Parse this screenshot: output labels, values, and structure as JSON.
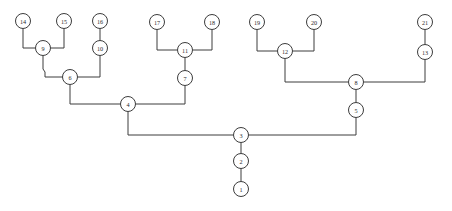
{
  "figure": {
    "type": "tree-diagram",
    "title": "",
    "background_color": "#ffffff",
    "line_color": "#3c3c3c",
    "node_fill_color": "#ffffff",
    "node_label_color": "#2b2b2b",
    "node_radius": 7.5,
    "width": 452,
    "height": 211
  },
  "chart_data": {
    "type": "table",
    "title": "",
    "nodes": [
      {
        "id": "1",
        "label": "1",
        "x": 241,
        "y": 189
      },
      {
        "id": "2",
        "label": "2",
        "x": 241,
        "y": 161
      },
      {
        "id": "3",
        "label": "3",
        "x": 241,
        "y": 135
      },
      {
        "id": "4",
        "label": "4",
        "x": 128,
        "y": 104
      },
      {
        "id": "5",
        "label": "5",
        "x": 356,
        "y": 110
      },
      {
        "id": "6",
        "label": "6",
        "x": 70,
        "y": 77
      },
      {
        "id": "7",
        "label": "7",
        "x": 185,
        "y": 78
      },
      {
        "id": "8",
        "label": "8",
        "x": 356,
        "y": 82
      },
      {
        "id": "9",
        "label": "9",
        "x": 43,
        "y": 48
      },
      {
        "id": "10",
        "label": "10",
        "x": 100,
        "y": 48
      },
      {
        "id": "11",
        "label": "11",
        "x": 185,
        "y": 50
      },
      {
        "id": "12",
        "label": "12",
        "x": 285,
        "y": 51
      },
      {
        "id": "13",
        "label": "13",
        "x": 425,
        "y": 52
      },
      {
        "id": "14",
        "label": "14",
        "x": 23,
        "y": 21
      },
      {
        "id": "15",
        "label": "15",
        "x": 64,
        "y": 21
      },
      {
        "id": "16",
        "label": "16",
        "x": 100,
        "y": 21
      },
      {
        "id": "17",
        "label": "17",
        "x": 157,
        "y": 22
      },
      {
        "id": "18",
        "label": "18",
        "x": 212,
        "y": 22
      },
      {
        "id": "19",
        "label": "19",
        "x": 257,
        "y": 22
      },
      {
        "id": "20",
        "label": "20",
        "x": 314,
        "y": 22
      },
      {
        "id": "21",
        "label": "21",
        "x": 425,
        "y": 22
      }
    ],
    "edges": [
      {
        "from": "1",
        "to": "2",
        "path": "M 241 181.5 L 241 168.5"
      },
      {
        "from": "2",
        "to": "3",
        "path": "M 241 153.5 L 241 142.5"
      },
      {
        "from": "3",
        "to": "4",
        "path": "M 233.5 135 L 128 135 L 128 111.5"
      },
      {
        "from": "3",
        "to": "5",
        "path": "M 248.5 135 L 356 135 L 356 117.5"
      },
      {
        "from": "4",
        "to": "6",
        "path": "M 128 104 L 70 104 L 70 84.5"
      },
      {
        "from": "4",
        "to": "7",
        "path": "M 135.5 104 L 185 104 L 185 85.5"
      },
      {
        "from": "6",
        "to": "9",
        "path": "M 70 77 L 45 77 L 45 72 L 43 69 L 43 55.5"
      },
      {
        "from": "6",
        "to": "10",
        "path": "M 77.5 77 L 100 77 L 100 55.5"
      },
      {
        "from": "9",
        "to": "14",
        "path": "M 35.5 48 L 23 48 L 23 28.5"
      },
      {
        "from": "9",
        "to": "15",
        "path": "M 50.5 48 L 64 48 L 64 28.5"
      },
      {
        "from": "10",
        "to": "16",
        "path": "M 100 40.5 L 100 28.5"
      },
      {
        "from": "7",
        "to": "11",
        "path": "M 185 70.5 L 185 57.5"
      },
      {
        "from": "11",
        "to": "17",
        "path": "M 177.5 50 L 157 50 L 157 29.5"
      },
      {
        "from": "11",
        "to": "18",
        "path": "M 192.5 50 L 212 50 L 212 29.5"
      },
      {
        "from": "5",
        "to": "8",
        "path": "M 356 102.5 L 356 89.5"
      },
      {
        "from": "8",
        "to": "12",
        "path": "M 348.5 82 L 285 82 L 285 58.5"
      },
      {
        "from": "8",
        "to": "13",
        "path": "M 363.5 82 L 425 82 L 425 59.5"
      },
      {
        "from": "12",
        "to": "19",
        "path": "M 277.5 51 L 257 51 L 257 29.5"
      },
      {
        "from": "12",
        "to": "20",
        "path": "M 292.5 51 L 314 51 L 314 29.5"
      },
      {
        "from": "13",
        "to": "21",
        "path": "M 425 44.5 L 425 29.5"
      }
    ]
  }
}
